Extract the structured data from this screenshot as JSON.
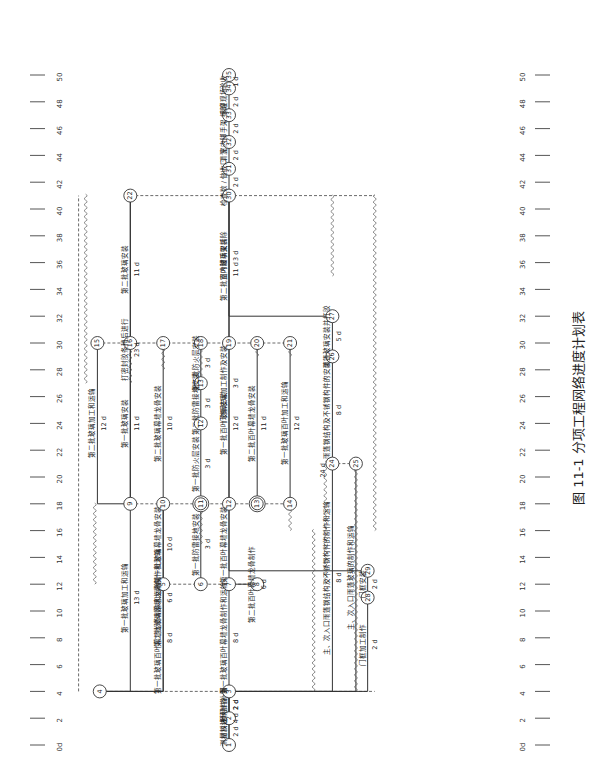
{
  "figure": {
    "caption": "图 11-1   分项工程网络进度计划表",
    "time_axis": {
      "unit_label": "0d",
      "ticks": [
        "0d",
        "2",
        "4",
        "6",
        "8",
        "10",
        "12",
        "14",
        "16",
        "18",
        "20",
        "22",
        "24",
        "26",
        "28",
        "30",
        "32",
        "34",
        "36",
        "38",
        "40",
        "42",
        "44",
        "46",
        "48",
        "50"
      ]
    }
  },
  "nodes": [
    {
      "id": "1",
      "t": 0,
      "lane": 10.0
    },
    {
      "id": "2",
      "t": 2,
      "lane": 10.0
    },
    {
      "id": "3",
      "t": 4,
      "lane": 10.0
    },
    {
      "id": "4",
      "t": 4,
      "lane": 4.5
    },
    {
      "id": "5",
      "t": 12,
      "lane": 7.2
    },
    {
      "id": "6",
      "t": 12,
      "lane": 8.8
    },
    {
      "id": "7",
      "t": 12,
      "lane": 10.0
    },
    {
      "id": "8",
      "t": 12,
      "lane": 11.2
    },
    {
      "id": "9",
      "t": 18,
      "lane": 5.8
    },
    {
      "id": "10",
      "t": 18,
      "lane": 7.2
    },
    {
      "id": "11",
      "t": 18,
      "lane": 8.8
    },
    {
      "id": "12",
      "t": 18,
      "lane": 10.0
    },
    {
      "id": "13",
      "t": 18,
      "lane": 11.2
    },
    {
      "id": "14",
      "t": 18,
      "lane": 12.6
    },
    {
      "id": "15",
      "t": 30,
      "lane": 4.4
    },
    {
      "id": "16",
      "t": 30,
      "lane": 5.8
    },
    {
      "id": "17",
      "t": 30,
      "lane": 7.2
    },
    {
      "id": "18",
      "t": 30,
      "lane": 8.8
    },
    {
      "id": "19",
      "t": 30,
      "lane": 10.0
    },
    {
      "id": "20",
      "t": 30,
      "lane": 11.2
    },
    {
      "id": "21",
      "t": 30,
      "lane": 12.6
    },
    {
      "id": "22",
      "t": 41,
      "lane": 5.8
    },
    {
      "id": "24",
      "t": 21,
      "lane": 14.4
    },
    {
      "id": "25",
      "t": 21,
      "lane": 15.4
    },
    {
      "id": "26",
      "t": 29,
      "lane": 14.4
    },
    {
      "id": "27",
      "t": 32,
      "lane": 14.4
    },
    {
      "id": "28",
      "t": 11,
      "lane": 15.9
    },
    {
      "id": "29",
      "t": 13,
      "lane": 15.9
    },
    {
      "id": "30",
      "t": 41,
      "lane": 10.0
    },
    {
      "id": "31",
      "t": 43,
      "lane": 10.0
    },
    {
      "id": "32",
      "t": 45,
      "lane": 10.0
    },
    {
      "id": "33",
      "t": 47,
      "lane": 10.0
    },
    {
      "id": "34",
      "t": 49,
      "lane": 10.0
    },
    {
      "id": "35",
      "t": 50,
      "lane": 10.0
    }
  ],
  "activities": [
    {
      "from": "1",
      "to": "2",
      "label": "测量放线",
      "dur": "2 d"
    },
    {
      "from": "2",
      "to": "3",
      "label": "",
      "dur": "2 d"
    },
    {
      "from": "2",
      "to": "3",
      "label": "预埋件补漏",
      "dur": "2 d",
      "note": "（后补埋）"
    },
    {
      "from": "1",
      "to": "3",
      "label": "材料进场准备",
      "dur": "4 d"
    },
    {
      "from": "4",
      "to": "5",
      "label": "第一批玻璃百叶幕墙龙骨制作和运输",
      "dur": "8 d"
    },
    {
      "from": "4",
      "to": "9",
      "label": "第一批玻璃加工和运输",
      "dur": "13 d"
    },
    {
      "from": "4",
      "to": "10",
      "label": "第二批玻璃幕墙龙骨制作和运输",
      "dur": "6 d"
    },
    {
      "from": "3",
      "to": "7",
      "label": "第一批玻璃百叶幕墙龙骨制作和运输",
      "dur": "8 d"
    },
    {
      "from": "5",
      "to": "10",
      "label": "第一批玻璃幕墙龙骨安装",
      "dur": "10 d"
    },
    {
      "from": "6",
      "to": "11",
      "label": "第一批防雷接地安装",
      "dur": "3 d"
    },
    {
      "from": "7",
      "to": "12",
      "label": "第一批百叶幕墙龙骨安装",
      "dur": ""
    },
    {
      "from": "7",
      "to": "8",
      "label": "第二批百叶幕墙龙骨制作",
      "dur": "6 d"
    },
    {
      "from": "9",
      "to": "15",
      "label": "第二批玻璃加工和运输",
      "dur": "12 d"
    },
    {
      "from": "9",
      "to": "16",
      "label": "第一批玻璃安装",
      "dur": "11 d"
    },
    {
      "from": "9",
      "to": "22",
      "label": "打密封胶条稍后进行",
      "dur": "23 d"
    },
    {
      "from": "10",
      "to": "17",
      "label": "第二批玻璃幕墙龙骨安装",
      "dur": "10 d"
    },
    {
      "from": "11",
      "to": "12b",
      "label": "第一批防火层安装",
      "dur": "3 d"
    },
    {
      "from": "12b",
      "to": "13b",
      "label": "第二批防雷接地安装",
      "dur": "3 d"
    },
    {
      "from": "13b",
      "to": "18",
      "label": "第二批防火层安装",
      "dur": "3 d"
    },
    {
      "from": "12",
      "to": "19",
      "label": "第一批百叶玻璃安装",
      "dur": "12 d"
    },
    {
      "from": "13",
      "to": "20",
      "label": "第二批百叶幕墙龙骨安装",
      "dur": "11 d"
    },
    {
      "from": "14",
      "to": "21",
      "label": "第一批玻璃百叶加工和运输",
      "dur": "12 d"
    },
    {
      "from": "16",
      "to": "22",
      "label": "第二批玻璃安装",
      "dur": "11 d"
    },
    {
      "from": "19",
      "to": "30",
      "label": "第二批百叶玻璃安装",
      "dur": "11 d"
    },
    {
      "from": "3",
      "to": "24",
      "label": "主、次入口雨篷钢结构及不锈钢构件的制作和运输",
      "dur": "8 d"
    },
    {
      "from": "3",
      "to": "25",
      "label": "主、次入口雨篷玻璃的制作和运输",
      "dur": ""
    },
    {
      "from": "24",
      "to": "26",
      "label": "雨篷钢结构及不锈钢构件的安装",
      "dur": "8 d"
    },
    {
      "from": "26",
      "to": "27",
      "label": "雨篷玻璃安装并打胶",
      "dur": "5 d"
    },
    {
      "from": "27",
      "to": "30",
      "label": "室内脚手架拆除",
      "dur": "3 d"
    },
    {
      "from": "3",
      "to": "28",
      "label": "门框加工制作",
      "dur": "2 d"
    },
    {
      "from": "28",
      "to": "29",
      "label": "门框安装",
      "dur": "2 d"
    },
    {
      "from": "29",
      "to": "30",
      "label": "门框玻璃加工制作及安装",
      "dur": "3 d"
    },
    {
      "from": "30",
      "to": "31",
      "label": "检查数 / 做收口",
      "dur": "2 d"
    },
    {
      "from": "31",
      "to": "32",
      "label": "清洗",
      "dur": "2 d"
    },
    {
      "from": "32",
      "to": "33",
      "label": "室内脚手架 拆除",
      "dur": "2 d"
    },
    {
      "from": "33",
      "to": "34",
      "label": "清理现场",
      "dur": "2 d"
    },
    {
      "from": "34",
      "to": "35",
      "label": "验收",
      "dur": "1 d"
    }
  ],
  "extra_labels": [
    {
      "text": "24 d",
      "ref": "3-24"
    }
  ]
}
